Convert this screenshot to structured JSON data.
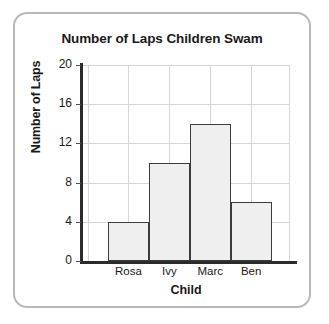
{
  "card": {
    "border_color": "#b8b8b8",
    "background": "#ffffff"
  },
  "chart_data": {
    "type": "bar",
    "title": "Number of Laps Children Swam",
    "xlabel": "Child",
    "ylabel": "Number of Laps",
    "categories": [
      "Rosa",
      "Ivy",
      "Marc",
      "Ben"
    ],
    "values": [
      4,
      10,
      14,
      6
    ],
    "ylim": [
      0,
      20
    ],
    "ytick_labels": [
      "0",
      "4",
      "8",
      "12",
      "16",
      "20"
    ],
    "ytick_values": [
      0,
      4,
      8,
      12,
      16,
      20
    ],
    "grid": true,
    "legend": "none",
    "bar_fill_color": "#efefef",
    "bar_border_color": "#3c3c3c",
    "gridline_color": "#d6d6d6",
    "axis_color": "#2b2b2b"
  }
}
